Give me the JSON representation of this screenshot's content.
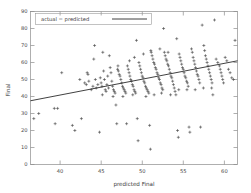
{
  "chart_data": {
    "type": "scatter",
    "title": "",
    "xlabel": "predicted Final",
    "ylabel": "Final",
    "xlim": [
      36.4,
      61.6
    ],
    "ylim": [
      0,
      90
    ],
    "xticks": [
      40,
      45,
      50,
      55,
      60
    ],
    "yticks": [
      0,
      10,
      20,
      30,
      40,
      50,
      60,
      70,
      80,
      90
    ],
    "grid": false,
    "legend_position": "top-left",
    "legend": [
      {
        "label": "actual = predicted",
        "marker": "line",
        "color": "#2b2b2b"
      }
    ],
    "series": [
      {
        "name": "observations",
        "marker": "plus",
        "color": "#333333",
        "points": [
          [
            36.8,
            27
          ],
          [
            37.4,
            30
          ],
          [
            39.3,
            33
          ],
          [
            39.7,
            33
          ],
          [
            39.4,
            24
          ],
          [
            40.2,
            54
          ],
          [
            41.5,
            23
          ],
          [
            41.8,
            20
          ],
          [
            42.4,
            50
          ],
          [
            42.6,
            27
          ],
          [
            43.0,
            48
          ],
          [
            43.3,
            54
          ],
          [
            43.2,
            47
          ],
          [
            43.5,
            49
          ],
          [
            43.4,
            53
          ],
          [
            43.8,
            44
          ],
          [
            44.0,
            46
          ],
          [
            44.2,
            70
          ],
          [
            44.1,
            62
          ],
          [
            44.3,
            50
          ],
          [
            44.4,
            45
          ],
          [
            44.6,
            47
          ],
          [
            44.8,
            19
          ],
          [
            44.9,
            51
          ],
          [
            45.0,
            48
          ],
          [
            45.1,
            46
          ],
          [
            45.2,
            66
          ],
          [
            45.3,
            55
          ],
          [
            45.4,
            50
          ],
          [
            45.5,
            44
          ],
          [
            45.6,
            43
          ],
          [
            45.7,
            47
          ],
          [
            45.8,
            52
          ],
          [
            45.9,
            45
          ],
          [
            46.0,
            64
          ],
          [
            46.1,
            57
          ],
          [
            46.2,
            54
          ],
          [
            46.3,
            49
          ],
          [
            46.4,
            46
          ],
          [
            46.5,
            44
          ],
          [
            46.6,
            43
          ],
          [
            46.7,
            42
          ],
          [
            46.8,
            35
          ],
          [
            46.9,
            24
          ],
          [
            47.0,
            56
          ],
          [
            47.1,
            55
          ],
          [
            47.2,
            53
          ],
          [
            47.3,
            52
          ],
          [
            47.4,
            50
          ],
          [
            47.5,
            48
          ],
          [
            47.6,
            46
          ],
          [
            47.7,
            45
          ],
          [
            47.8,
            44
          ],
          [
            47.9,
            43
          ],
          [
            48.0,
            42
          ],
          [
            48.1,
            24
          ],
          [
            48.2,
            58
          ],
          [
            48.3,
            56
          ],
          [
            48.4,
            54
          ],
          [
            48.5,
            52
          ],
          [
            48.6,
            50
          ],
          [
            48.7,
            49
          ],
          [
            48.8,
            47
          ],
          [
            48.9,
            46
          ],
          [
            49.0,
            44
          ],
          [
            49.1,
            43
          ],
          [
            49.2,
            42
          ],
          [
            49.3,
            73
          ],
          [
            49.4,
            27
          ],
          [
            49.5,
            14
          ],
          [
            49.6,
            60
          ],
          [
            49.7,
            58
          ],
          [
            49.8,
            56
          ],
          [
            49.9,
            54
          ],
          [
            50.0,
            52
          ],
          [
            50.1,
            51
          ],
          [
            50.2,
            49
          ],
          [
            50.3,
            48
          ],
          [
            50.4,
            46
          ],
          [
            50.5,
            45
          ],
          [
            50.6,
            44
          ],
          [
            50.7,
            43
          ],
          [
            50.8,
            42
          ],
          [
            50.9,
            23
          ],
          [
            51.0,
            9
          ],
          [
            51.1,
            66
          ],
          [
            51.2,
            64
          ],
          [
            51.3,
            62
          ],
          [
            51.4,
            60
          ],
          [
            51.5,
            59
          ],
          [
            51.6,
            57
          ],
          [
            51.7,
            56
          ],
          [
            51.8,
            54
          ],
          [
            51.9,
            53
          ],
          [
            52.0,
            51
          ],
          [
            52.1,
            50
          ],
          [
            52.2,
            48
          ],
          [
            52.3,
            47
          ],
          [
            52.4,
            45
          ],
          [
            52.5,
            44
          ],
          [
            52.6,
            80
          ],
          [
            52.7,
            66
          ],
          [
            52.8,
            64
          ],
          [
            52.9,
            62
          ],
          [
            53.0,
            61
          ],
          [
            53.1,
            59
          ],
          [
            53.2,
            58
          ],
          [
            53.3,
            56
          ],
          [
            53.4,
            54
          ],
          [
            53.5,
            52
          ],
          [
            53.6,
            51
          ],
          [
            53.7,
            49
          ],
          [
            53.8,
            47
          ],
          [
            53.9,
            45
          ],
          [
            54.0,
            43
          ],
          [
            54.1,
            41
          ],
          [
            54.2,
            74
          ],
          [
            54.3,
            20
          ],
          [
            54.4,
            16
          ],
          [
            54.5,
            65
          ],
          [
            54.6,
            63
          ],
          [
            54.7,
            61
          ],
          [
            54.8,
            59
          ],
          [
            54.9,
            57
          ],
          [
            55.0,
            56
          ],
          [
            55.1,
            54
          ],
          [
            55.2,
            52
          ],
          [
            55.3,
            51
          ],
          [
            55.4,
            49
          ],
          [
            55.5,
            48
          ],
          [
            55.6,
            46
          ],
          [
            55.7,
            22
          ],
          [
            55.8,
            19
          ],
          [
            56.0,
            68
          ],
          [
            56.1,
            66
          ],
          [
            56.2,
            63
          ],
          [
            56.3,
            61
          ],
          [
            56.4,
            59
          ],
          [
            56.5,
            57
          ],
          [
            56.6,
            55
          ],
          [
            56.7,
            53
          ],
          [
            56.8,
            52
          ],
          [
            56.9,
            50
          ],
          [
            57.0,
            48
          ],
          [
            57.1,
            22
          ],
          [
            57.3,
            82
          ],
          [
            57.5,
            70
          ],
          [
            57.6,
            67
          ],
          [
            57.7,
            64
          ],
          [
            57.8,
            62
          ],
          [
            57.9,
            60
          ],
          [
            58.0,
            58
          ],
          [
            58.1,
            56
          ],
          [
            58.2,
            54
          ],
          [
            58.3,
            52
          ],
          [
            58.4,
            50
          ],
          [
            58.5,
            48
          ],
          [
            58.6,
            41
          ],
          [
            58.8,
            85
          ],
          [
            59.0,
            62
          ],
          [
            59.2,
            60
          ],
          [
            59.4,
            58
          ],
          [
            59.5,
            56
          ],
          [
            59.6,
            54
          ],
          [
            59.7,
            52
          ],
          [
            59.8,
            50
          ],
          [
            59.9,
            48
          ],
          [
            60.1,
            63
          ],
          [
            60.3,
            61
          ],
          [
            60.5,
            56
          ],
          [
            60.7,
            54
          ],
          [
            60.9,
            51
          ],
          [
            61.1,
            50
          ],
          [
            61.3,
            73
          ],
          [
            47.05,
            58
          ],
          [
            48.45,
            61
          ],
          [
            49.05,
            63
          ],
          [
            50.15,
            65
          ],
          [
            51.05,
            67
          ],
          [
            52.15,
            68
          ],
          [
            53.15,
            66
          ],
          [
            45.15,
            41
          ],
          [
            46.45,
            40
          ],
          [
            47.65,
            40
          ],
          [
            48.85,
            41
          ],
          [
            50.45,
            40
          ],
          [
            51.45,
            41
          ],
          [
            52.35,
            42
          ],
          [
            53.45,
            41
          ],
          [
            54.45,
            44
          ],
          [
            55.45,
            44
          ],
          [
            56.45,
            44
          ],
          [
            57.45,
            45
          ],
          [
            58.45,
            45
          ]
        ]
      }
    ],
    "fit_line": {
      "name": "actual = predicted",
      "x_start": 36.4,
      "y_start": 37.5,
      "x_end": 61.6,
      "y_end": 61.0,
      "color": "#2b2b2b"
    }
  },
  "axes": {
    "x_title": "predicted Final",
    "y_title": "Final",
    "x_tick_labels": [
      "40",
      "45",
      "50",
      "55",
      "60"
    ],
    "y_tick_labels": [
      "0",
      "10",
      "20",
      "30",
      "40",
      "50",
      "60",
      "70",
      "80",
      "90"
    ]
  },
  "legend": {
    "entry_label": "actual = predicted"
  }
}
